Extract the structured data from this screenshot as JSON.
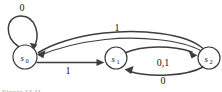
{
  "figure": {
    "type": "finite-state-machine-diagram",
    "caption": "Figure 13.11",
    "background_color": "#ffffff",
    "stroke_color": "#3d3d3d",
    "text_color": "#141414"
  },
  "states": [
    {
      "id": "s0",
      "label": "s",
      "subscript": "0",
      "cx": 25,
      "cy": 57,
      "r": 12
    },
    {
      "id": "s1",
      "label": "s",
      "subscript": "1",
      "cx": 116,
      "cy": 58,
      "r": 11
    },
    {
      "id": "s2",
      "label": "s",
      "subscript": "2",
      "cx": 209,
      "cy": 58,
      "r": 11
    }
  ],
  "transitions": [
    {
      "id": "t-s0-s0",
      "from": "s0",
      "to": "s0",
      "label": "0",
      "label_x": 22,
      "label_y": 11,
      "kind": "self-loop"
    },
    {
      "id": "t-s0-s1",
      "from": "s0",
      "to": "s1",
      "label": "1",
      "label_x": 68,
      "label_y": 74,
      "kind": "straight"
    },
    {
      "id": "t-s1-s2",
      "from": "s1",
      "to": "s2",
      "label": "0,1",
      "label_x": 163,
      "label_y": 66,
      "kind": "curve-up"
    },
    {
      "id": "t-s2-s1",
      "from": "s2",
      "to": "s1",
      "label": "0",
      "label_x": 163,
      "label_y": 84,
      "kind": "curve-down"
    },
    {
      "id": "t-s2-s0",
      "from": "s2",
      "to": "s0",
      "label": "1",
      "label_x": 117,
      "label_y": 31,
      "kind": "long-arc"
    }
  ]
}
